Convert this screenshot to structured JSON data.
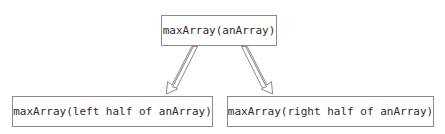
{
  "diagram": {
    "background_color": "#ffffff",
    "border_color": "#8a8a8a",
    "text_color": "#2b2b2b",
    "nodes": [
      {
        "id": "root",
        "label": "maxArray(anArray)",
        "role": "parent-call"
      },
      {
        "id": "left",
        "label": "maxArray(left half of anArray)",
        "role": "recursive-call-left"
      },
      {
        "id": "right",
        "label": "maxArray(right half of anArray)",
        "role": "recursive-call-right"
      }
    ],
    "edges": [
      {
        "id": "root-to-left",
        "from": "root",
        "to": "left",
        "style": "hollow-open-arrow"
      },
      {
        "id": "root-to-right",
        "from": "root",
        "to": "right",
        "style": "hollow-open-arrow"
      }
    ]
  }
}
